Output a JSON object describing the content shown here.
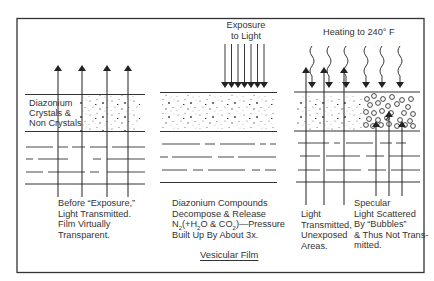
{
  "figure": {
    "title": "Vesicular Film",
    "frame_color": "#333333"
  },
  "panels": [
    {
      "id": "before-exposure",
      "layer_label": [
        "Diazonium",
        "Crystals &",
        "Non Crystals"
      ],
      "description": [
        "Before “Exposure,”",
        "Light Transmitted.",
        "Film Virtually",
        "Transparent."
      ],
      "arrows": "4 upward arrows passing through film"
    },
    {
      "id": "exposure",
      "top_label": [
        "Exposure",
        "to Light"
      ],
      "description_parts": {
        "line1": "Diazonium Compounds",
        "line2": "Decompose & Release",
        "line3_pre": "N",
        "line3_sub1": "2",
        "line3_mid1": "(+H",
        "line3_sub2": "2",
        "line3_mid2": "O & CO",
        "line3_sub3": "2",
        "line3_post": ")—Pressure",
        "line4": "Built Up By About 3x."
      },
      "arrows": "7 downward arrows onto film"
    },
    {
      "id": "heating",
      "top_label": "Heating to 240° F",
      "left_description": [
        "Light",
        "Transmitted,",
        "Unexposed",
        "Areas."
      ],
      "right_description": [
        "Specular",
        "Light Scattered",
        "By “Bubbles”",
        "& Thus Not Trans-",
        "mitted."
      ],
      "arrows": "6 wavy downward heat arrows; 3 upward arrows transmitted, 3 upward arrows scattered by bubbles"
    }
  ]
}
